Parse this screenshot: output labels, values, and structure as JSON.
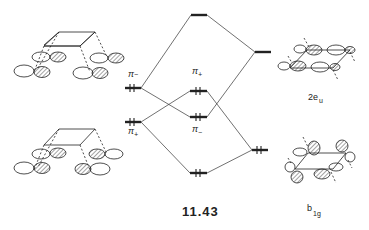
{
  "figure": {
    "label": "11.43",
    "type": "molecular orbital interaction diagram"
  },
  "colors": {
    "ink": "#222222",
    "background": "#ffffff",
    "hatch": "#333333"
  },
  "left_levels": [
    {
      "id": "pi-minus-left",
      "symbol": "π",
      "subscript": "−",
      "occupied": true,
      "electrons": 2
    },
    {
      "id": "pi-plus-left",
      "symbol": "π",
      "subscript": "+",
      "occupied": true,
      "electrons": 2
    }
  ],
  "center_levels": [
    {
      "id": "center-top",
      "occupied": false
    },
    {
      "id": "pi-plus-center",
      "symbol": "π",
      "subscript": "+",
      "occupied": true,
      "electrons": 2
    },
    {
      "id": "pi-minus-center",
      "symbol": "π",
      "subscript": "−",
      "occupied": true,
      "electrons": 2
    },
    {
      "id": "center-bottom",
      "occupied": true,
      "electrons": 2
    }
  ],
  "right_levels": [
    {
      "id": "2eu",
      "symbol": "2e",
      "subscript": "u",
      "occupied": false
    },
    {
      "id": "b1g",
      "symbol": "b",
      "subscript": "1g",
      "occupied": true,
      "electrons": 2
    }
  ],
  "labels": {
    "left_pi_minus": {
      "main": "π",
      "sub": "−"
    },
    "left_pi_plus": {
      "main": "π",
      "sub": "+"
    },
    "center_pi_plus": {
      "main": "π",
      "sub": "+"
    },
    "center_pi_minus": {
      "main": "π",
      "sub": "−"
    },
    "right_upper": {
      "main": "2e",
      "sub": "u"
    },
    "right_lower": {
      "main": "b",
      "sub": "1g"
    }
  }
}
